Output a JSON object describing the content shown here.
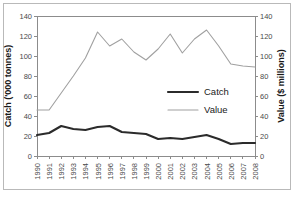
{
  "chart_data": {
    "type": "line",
    "title": "",
    "xlabel": "",
    "ylabel": "Catch ('000 tonnes)",
    "y2label": "Value ($ millions)",
    "grid": false,
    "legend_position": "center-right",
    "categories": [
      "1990",
      "1991",
      "1992",
      "1993",
      "1994",
      "1995",
      "1996",
      "1997",
      "1998",
      "1999",
      "2000",
      "2001",
      "2002",
      "2003",
      "2004",
      "2005",
      "2006",
      "2007",
      "2008"
    ],
    "ylim": [
      0,
      140
    ],
    "y2lim": [
      0,
      140
    ],
    "yticks": [
      0,
      20,
      40,
      60,
      80,
      100,
      120,
      140
    ],
    "y2ticks": [
      0,
      20,
      40,
      60,
      80,
      100,
      120,
      140
    ],
    "ytick_labels": [
      "0",
      "20",
      "40",
      "60",
      "80",
      "100",
      "120",
      "140"
    ],
    "y2tick_labels": [
      "0",
      "20",
      "40",
      "60",
      "80",
      "100",
      "120",
      "140"
    ],
    "series": [
      {
        "name": "Catch",
        "axis": "left",
        "color": "#2b2b2b",
        "values": [
          21,
          23,
          30,
          27,
          26,
          29,
          30,
          24,
          23,
          22,
          17,
          18,
          17,
          19,
          21,
          17,
          12,
          13,
          13
        ]
      },
      {
        "name": "Value",
        "axis": "right",
        "color": "#a0a0a0",
        "values": [
          46,
          46,
          63,
          80,
          98,
          124,
          110,
          117,
          104,
          96,
          107,
          122,
          103,
          117,
          126,
          110,
          92,
          90,
          89
        ]
      }
    ],
    "legend": [
      {
        "label": "Catch",
        "color": "#2b2b2b",
        "width": 2.1
      },
      {
        "label": "Value",
        "color": "#a0a0a0",
        "width": 1.1
      }
    ]
  },
  "colors": {
    "catch": "#2b2b2b",
    "value": "#a0a0a0",
    "axis": "#8c8c8c",
    "text": "#4a4a4a",
    "border": "#b9b9b9",
    "background": "#ffffff"
  }
}
